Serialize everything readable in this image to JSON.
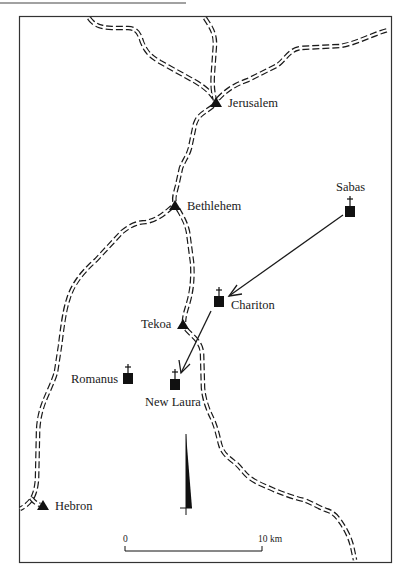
{
  "map": {
    "colors": {
      "ink": "#1a1a1a",
      "background": "#ffffff"
    },
    "legend_symbols": {
      "town": "triangle-icon",
      "monastery": "square-with-cross-icon",
      "road": "double-dashed-line"
    },
    "towns": [
      {
        "name": "Jerusalem",
        "x": 216,
        "y": 103
      },
      {
        "name": "Bethlehem",
        "x": 175,
        "y": 206
      },
      {
        "name": "Tekoa",
        "x": 183,
        "y": 325
      },
      {
        "name": "Hebron",
        "x": 43,
        "y": 506
      }
    ],
    "monasteries": [
      {
        "name": "Sabas",
        "x": 350,
        "y": 212
      },
      {
        "name": "Chariton",
        "x": 219,
        "y": 301
      },
      {
        "name": "Romanus",
        "x": 128,
        "y": 378
      },
      {
        "name": "New Laura",
        "x": 175,
        "y": 385
      }
    ],
    "arrows": [
      {
        "from": "Sabas",
        "to": "Chariton"
      },
      {
        "from": "Chariton",
        "to": "New Laura"
      }
    ],
    "north_arrow": {
      "x": 186,
      "tip_y": 434,
      "base_y": 508
    },
    "scale_bar": {
      "start_label": "0",
      "end_label": "10 km",
      "length_km": 10
    }
  }
}
